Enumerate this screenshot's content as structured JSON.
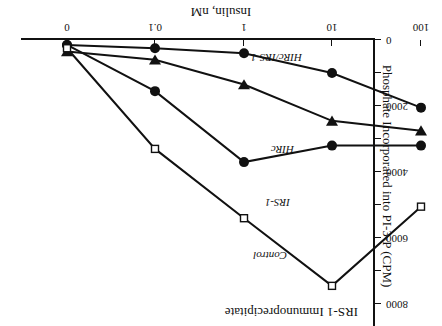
{
  "chart_data": {
    "type": "line",
    "title": "IRS-1 Immunoprecipitate",
    "xlabel": "Insulin, nM",
    "ylabel": "Phosphate Incorporated into PI-3-P (CPM)",
    "xscale": "log-with-zero",
    "xticklabels": [
      "0",
      "0.1",
      "1",
      "10",
      "100"
    ],
    "yticklabels": [
      "0",
      "2000",
      "4000",
      "6000",
      "8000"
    ],
    "ylim": [
      0,
      8700
    ],
    "grid": false,
    "legend_position": "inline-labels",
    "x_positions_px": [
      375,
      287,
      198,
      110,
      21
    ],
    "series": [
      {
        "name": "Control",
        "marker": "filled-circle",
        "x": [
          "0",
          "0.1",
          "1",
          "10",
          "100"
        ],
        "values": [
          150,
          250,
          400,
          1000,
          2050
        ]
      },
      {
        "name": "IRS-1",
        "marker": "filled-triangle-down",
        "x": [
          "0",
          "0.1",
          "1",
          "10",
          "100"
        ],
        "values": [
          350,
          600,
          1350,
          2450,
          2750
        ]
      },
      {
        "name": "HIRc",
        "marker": "filled-circle",
        "x": [
          "0",
          "0.1",
          "1",
          "10",
          "100"
        ],
        "values": [
          150,
          1550,
          3700,
          3200,
          3200
        ]
      },
      {
        "name": "HIRc/IRS-1",
        "marker": "open-square",
        "x": [
          "0",
          "0.1",
          "1",
          "10",
          "100"
        ],
        "values": [
          250,
          3300,
          5400,
          7450,
          5050
        ]
      }
    ]
  },
  "figure": {
    "orientation_note": "180",
    "top_edge_text": ""
  }
}
